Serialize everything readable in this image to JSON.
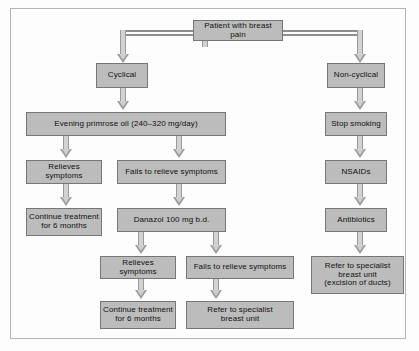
{
  "figure": {
    "type": "flowchart",
    "frame": {
      "border_color": "#b4b4b4"
    },
    "style": {
      "node_fill": "#bcbcbc",
      "node_border": "#767676",
      "connector_color": "#8e8e8e",
      "arrow_fill": "#cfcfcf",
      "text_color": "#111111"
    }
  },
  "nodes": {
    "root": {
      "label": "Patient with breast pain"
    },
    "cyclical": {
      "label": "Cyclical"
    },
    "non_cyclical": {
      "label": "Non-cyclical"
    },
    "evening_primrose": {
      "label": "Evening primrose oil (240–320 mg/day)"
    },
    "epo_relieves": {
      "label": "Relieves symptoms"
    },
    "epo_fails": {
      "label": "Fails to relieve symptoms"
    },
    "epo_continue": {
      "line1": "Continue treatment",
      "line2": "for 6 months"
    },
    "danazol": {
      "label": "Danazol 100 mg b.d."
    },
    "dan_relieves": {
      "label": "Relieves symptoms"
    },
    "dan_fails": {
      "label": "Fails to relieve symptoms"
    },
    "dan_continue": {
      "line1": "Continue treatment",
      "line2": "for 6 months"
    },
    "dan_refer": {
      "line1": "Refer to specialist",
      "line2": "breast unit"
    },
    "stop_smoking": {
      "label": "Stop smoking"
    },
    "nsaids": {
      "label": "NSAIDs"
    },
    "antibiotics": {
      "label": "Antibiotics"
    },
    "nc_refer": {
      "line1": "Refer to specialist",
      "line2": "breast unit",
      "line3": "(excision of ducts)"
    }
  },
  "edges": [
    {
      "from": "root",
      "to": "cyclical"
    },
    {
      "from": "root",
      "to": "non_cyclical"
    },
    {
      "from": "cyclical",
      "to": "evening_primrose"
    },
    {
      "from": "evening_primrose",
      "to": "epo_relieves"
    },
    {
      "from": "evening_primrose",
      "to": "epo_fails"
    },
    {
      "from": "epo_relieves",
      "to": "epo_continue"
    },
    {
      "from": "epo_fails",
      "to": "danazol"
    },
    {
      "from": "danazol",
      "to": "dan_relieves"
    },
    {
      "from": "danazol",
      "to": "dan_fails"
    },
    {
      "from": "dan_relieves",
      "to": "dan_continue"
    },
    {
      "from": "dan_fails",
      "to": "dan_refer"
    },
    {
      "from": "non_cyclical",
      "to": "stop_smoking"
    },
    {
      "from": "stop_smoking",
      "to": "nsaids"
    },
    {
      "from": "nsaids",
      "to": "antibiotics"
    },
    {
      "from": "antibiotics",
      "to": "nc_refer"
    }
  ]
}
